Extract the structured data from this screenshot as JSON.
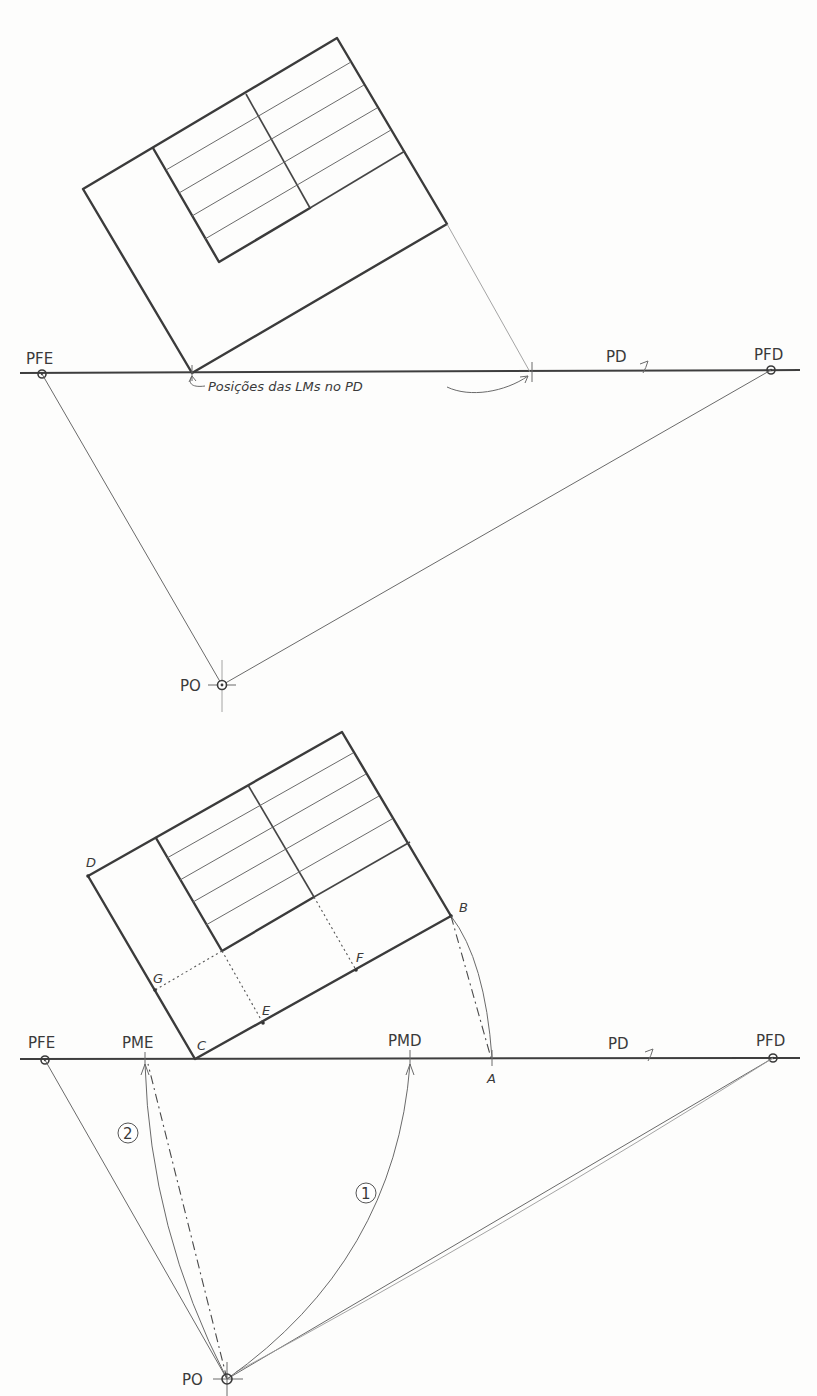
{
  "figure_top": {
    "labels": {
      "pfe": "PFE",
      "pfd": "PFD",
      "pd": "PD",
      "po": "PO",
      "annotation": "Posições das LMs no PD"
    }
  },
  "figure_bottom": {
    "labels": {
      "pfe": "PFE",
      "pme": "PME",
      "pmd": "PMD",
      "pd": "PD",
      "pfd": "PFD",
      "po": "PO",
      "a": "A",
      "b": "B",
      "c": "C",
      "d": "D",
      "e": "E",
      "f": "F",
      "g": "G",
      "step1": "1",
      "step2": "2"
    }
  },
  "colors": {
    "ink": "#3b3b3b",
    "paper": "#fdfdfc"
  }
}
